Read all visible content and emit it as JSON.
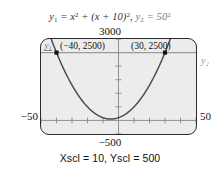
{
  "figure": {
    "equation_caption": {
      "y1_name": "y",
      "y1_sub": "1",
      "y1_body_a": " = x",
      "y1_exp_a": "2",
      "y1_body_b": " + (x + 10)",
      "y1_exp_b": "2",
      "separator": ",  ",
      "y2_name": "y",
      "y2_sub": "2",
      "y2_body": " = 50",
      "y2_exp": "2"
    },
    "window": {
      "ymax_label": "3000",
      "ymin_label": "−500",
      "xmin_label": "−50",
      "xmax_label": "50",
      "scale_label": "Xscl = 10, Yscl = 500",
      "xmin": -50,
      "xmax": 50,
      "ymin": -500,
      "ymax": 3000,
      "xscl": 10,
      "yscl": 500
    },
    "screen": {
      "background_color": "#ececec",
      "border_color": "#2b2b2b",
      "curve_color": "#4c4c4c",
      "line_color": "#9a9a9a",
      "axis_color": "#8f8f8f",
      "marker_color": "#111111"
    },
    "curve_labels": {
      "y1_tag": "y₁",
      "y2_tag": "y₂"
    },
    "intersections": [
      {
        "label": "(−40, 2500)",
        "x": -40,
        "y": 2500
      },
      {
        "label": "(30, 2500)",
        "x": 30,
        "y": 2500
      }
    ]
  },
  "chart_data": {
    "type": "line",
    "xlabel": "x",
    "ylabel": "y",
    "xlim": [
      -50,
      50
    ],
    "ylim": [
      -500,
      3000
    ],
    "xscl": 10,
    "yscl": 500,
    "grid": false,
    "legend": "inline-curve-tags",
    "series": [
      {
        "name": "y1",
        "type": "parabola",
        "expression": "x^2 + (x + 10)^2",
        "expanded": "2x^2 + 20x + 100",
        "vertex": [
          -5,
          50
        ],
        "x": [
          -50,
          -45,
          -40,
          -35,
          -30,
          -25,
          -20,
          -15,
          -10,
          -5,
          0,
          5,
          10,
          15,
          20,
          25,
          30,
          35,
          40,
          45,
          50
        ],
        "values": [
          4100,
          3250,
          2500,
          1850,
          1300,
          850,
          500,
          250,
          100,
          50,
          100,
          250,
          500,
          850,
          1300,
          1850,
          2500,
          3250,
          4100,
          5050,
          6100
        ]
      },
      {
        "name": "y2",
        "type": "horizontal-line",
        "expression": "50^2",
        "value": 2500,
        "x": [
          -50,
          50
        ],
        "values": [
          2500,
          2500
        ]
      }
    ],
    "annotations": [
      {
        "text": "(−40, 2500)",
        "x": -40,
        "y": 2500,
        "marker": "square"
      },
      {
        "text": "(30, 2500)",
        "x": 30,
        "y": 2500,
        "marker": "square"
      }
    ]
  }
}
